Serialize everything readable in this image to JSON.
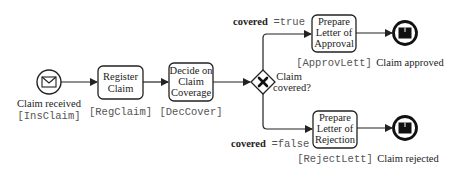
{
  "diagram": {
    "type": "BPMN process",
    "colors": {
      "stroke": "#222222",
      "text": "#222222",
      "code": "#555555",
      "background": "#ffffff"
    },
    "start_event": {
      "label": "Claim received",
      "code": "[InsClaim]",
      "icon": "envelope-icon"
    },
    "tasks": [
      {
        "id": "reg",
        "lines": [
          "Register",
          "Claim"
        ],
        "code": "[RegClaim]"
      },
      {
        "id": "dec",
        "lines": [
          "Decide on",
          "Claim",
          "Coverage"
        ],
        "code": "[DecCover]"
      },
      {
        "id": "approv",
        "lines": [
          "Prepare",
          "Letter of",
          "Approval"
        ],
        "code": "[ApprovLett]"
      },
      {
        "id": "reject",
        "lines": [
          "Prepare",
          "Letter of",
          "Rejection"
        ],
        "code": "[RejectLett]"
      }
    ],
    "gateway": {
      "type": "exclusive",
      "lines": [
        "Claim",
        "covered?"
      ],
      "icon": "x-icon"
    },
    "conditions": {
      "true": {
        "var": "covered",
        "op_val": "=true"
      },
      "false": {
        "var": "covered",
        "op_val": "=false"
      }
    },
    "end_events": [
      {
        "label": "Claim approved",
        "icon": "message-end-icon"
      },
      {
        "label": "Claim rejected",
        "icon": "message-end-icon"
      }
    ]
  }
}
